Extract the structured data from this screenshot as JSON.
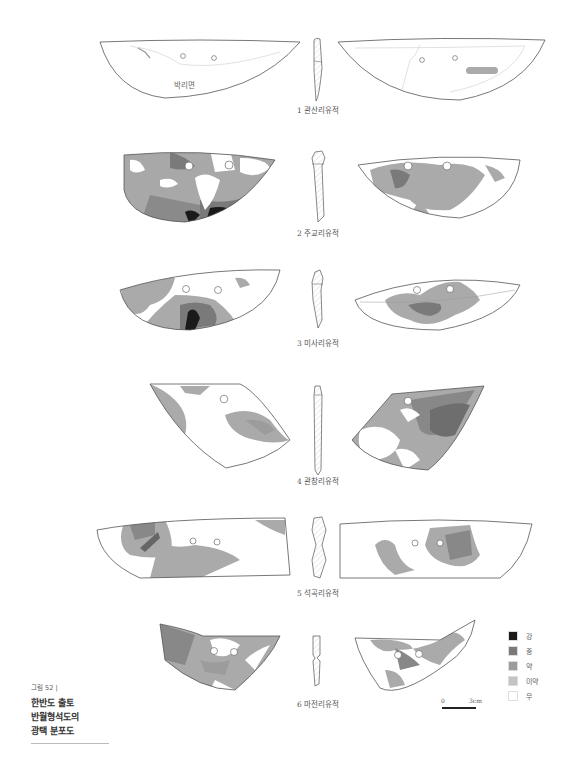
{
  "figure": {
    "caption_number": "그림 52 |",
    "caption_lines": [
      "한반도 출토",
      "반월형석도의",
      "광택 분포도"
    ]
  },
  "artifacts": [
    {
      "index": 1,
      "label": "1 관산리유적",
      "left_face_text": "박리면",
      "right_face_text": "박리면"
    },
    {
      "index": 2,
      "label": "2 주교리유적"
    },
    {
      "index": 3,
      "label": "3 미사리유적"
    },
    {
      "index": 4,
      "label": "4 관창리유적"
    },
    {
      "index": 5,
      "label": "5 석곡리유적"
    },
    {
      "index": 6,
      "label": "6 마전리유적"
    }
  ],
  "legend": {
    "items": [
      {
        "label": "강",
        "color": "#1a1a1a"
      },
      {
        "label": "중",
        "color": "#7a7a7a"
      },
      {
        "label": "약",
        "color": "#9c9c9c"
      },
      {
        "label": "미약",
        "color": "#c4c4c4"
      },
      {
        "label": "무",
        "color": "#ffffff"
      }
    ]
  },
  "scale_bar": {
    "start": "0",
    "end": "3cm"
  },
  "colors": {
    "strong": "#1a1a1a",
    "medium": "#7a7a7a",
    "weak": "#9c9c9c",
    "faint": "#c4c4c4",
    "outline": "#555555"
  }
}
